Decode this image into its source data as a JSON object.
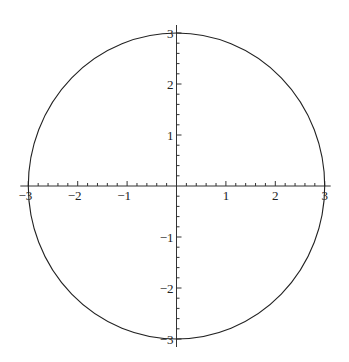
{
  "chart_data": {
    "type": "line",
    "title": "",
    "xlabel": "",
    "ylabel": "",
    "xlim": [
      -3,
      3
    ],
    "ylim": [
      -3,
      3
    ],
    "grid": false,
    "legend": null,
    "x_ticks": [
      -3,
      -2,
      -1,
      1,
      2,
      3
    ],
    "y_ticks": [
      -3,
      -2,
      -1,
      1,
      2,
      3
    ],
    "x_tick_labels": [
      "−3",
      "−2",
      "−1",
      "1",
      "2",
      "3"
    ],
    "y_tick_labels": [
      "−3",
      "−2",
      "−1",
      "1",
      "2",
      "3"
    ],
    "minor_tick_step": 0.2,
    "series": [
      {
        "name": "circle",
        "shape": "circle",
        "center": [
          0,
          0
        ],
        "radius": 3,
        "color": "#222222"
      }
    ]
  },
  "layout": {
    "origin_px": [
      176.5,
      186
    ],
    "unit_px_x": 49.4,
    "unit_px_y": 51,
    "axis_color": "#333333",
    "curve_color": "#222222"
  }
}
